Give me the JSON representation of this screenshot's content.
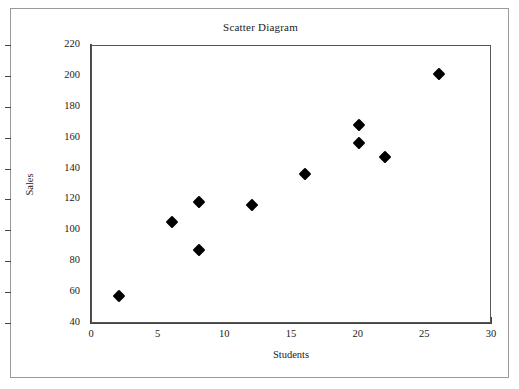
{
  "chart_data": {
    "type": "scatter",
    "title": "Scatter Diagram",
    "xlabel": "Students",
    "ylabel": "Sales",
    "xlim": [
      0,
      30
    ],
    "ylim": [
      40,
      220
    ],
    "xticks": [
      0,
      5,
      10,
      15,
      20,
      25,
      30
    ],
    "yticks": [
      40,
      60,
      80,
      100,
      120,
      140,
      160,
      180,
      200,
      220
    ],
    "grid": false,
    "legend": null,
    "marker": "diamond",
    "marker_color": "#000000",
    "points": [
      {
        "x": 2,
        "y": 58
      },
      {
        "x": 6,
        "y": 106
      },
      {
        "x": 8,
        "y": 119
      },
      {
        "x": 8,
        "y": 88
      },
      {
        "x": 12,
        "y": 117
      },
      {
        "x": 16,
        "y": 137
      },
      {
        "x": 20,
        "y": 169
      },
      {
        "x": 20,
        "y": 157
      },
      {
        "x": 22,
        "y": 148
      },
      {
        "x": 26,
        "y": 202
      }
    ],
    "x": [
      2,
      6,
      8,
      8,
      12,
      16,
      20,
      20,
      22,
      26
    ],
    "y": [
      58,
      106,
      119,
      88,
      117,
      137,
      169,
      157,
      148,
      202
    ]
  },
  "colors": {
    "outer_border": "#9a9a9a",
    "axis": "#444444",
    "plot_border": "#555555",
    "text": "#1a1a1a",
    "background": "#ffffff"
  }
}
